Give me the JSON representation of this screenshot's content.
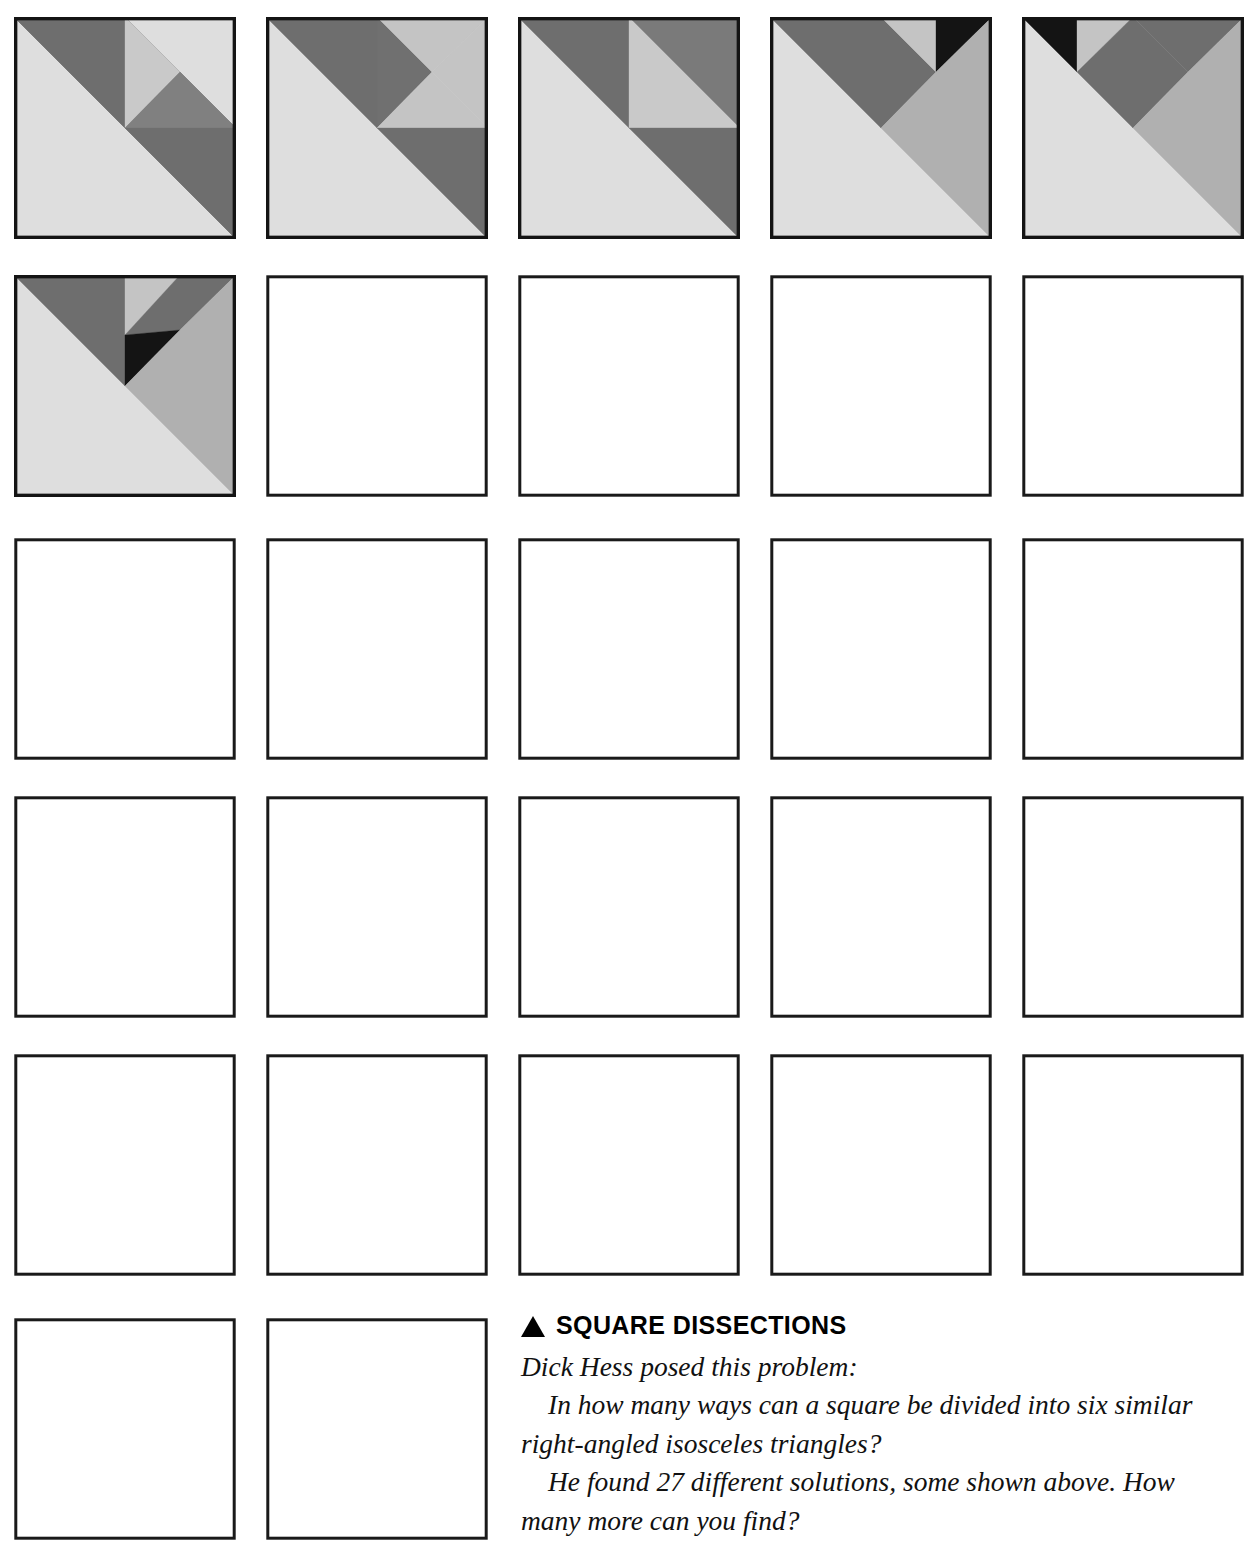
{
  "page": {
    "width": 1251,
    "height": 1553,
    "background": "#ffffff"
  },
  "palette": {
    "dark_gray": "#6e6e6e",
    "mid_gray": "#a8a8a8",
    "light_gray": "#bfbfbf",
    "pale_gray": "#dedede",
    "black": "#141414",
    "outline": "#141414",
    "white": "#ffffff"
  },
  "caption": {
    "bullet": "triangle-up-icon",
    "heading": "SQUARE DISSECTIONS",
    "attribution": "Dick Hess posed this problem:",
    "question": "In how many ways can a square be divided into six similar right-angled isosceles triangles?",
    "answer": "He found 27 different solutions, some shown above. How many more can you find?"
  },
  "grid": {
    "columns": 5,
    "rows": 6,
    "filled_count": 6,
    "empty_count": 21,
    "total_cells": 27,
    "cell_size": 222,
    "col_x": [
      14,
      266,
      518,
      770,
      1022
    ],
    "row_y": [
      17,
      275,
      538,
      796,
      1054,
      1318
    ],
    "row_counts": [
      5,
      5,
      5,
      5,
      5,
      2
    ]
  },
  "solutions": [
    {
      "index": 1,
      "label": "square-dissection-1",
      "filled": true,
      "pieces": [
        {
          "name": "large-lower-left-triangle",
          "color": "#dedede",
          "points": "0,0 0,222 222,222"
        },
        {
          "name": "upper-right-dark-band",
          "color": "#6e6e6e",
          "points": "0,0 222,222 222,111 111,0"
        },
        {
          "name": "upper-dark-left-wedge",
          "color": "#6e6e6e",
          "points": "0,0 111,0 111,111"
        },
        {
          "name": "small-pale-triangle",
          "color": "#c9c9c9",
          "points": "111,0 111,111 166,55"
        },
        {
          "name": "center-gray-triangle",
          "color": "#808080",
          "points": "111,111 166,55 222,111"
        },
        {
          "name": "mid-dark-triangle",
          "color": "#6e6e6e",
          "points": "111,111 222,111 222,222"
        }
      ]
    },
    {
      "index": 2,
      "label": "square-dissection-2",
      "filled": true,
      "pieces": [
        {
          "name": "large-lower-left-triangle",
          "color": "#dedede",
          "points": "0,0 0,222 222,222"
        },
        {
          "name": "upper-dark-band",
          "color": "#6e6e6e",
          "points": "0,0 111,111 111,0"
        },
        {
          "name": "quadrant-dark-corner",
          "color": "#707070",
          "points": "111,0 166,55 111,111"
        },
        {
          "name": "pale-upper-wedge",
          "color": "#c4c4c4",
          "points": "111,0 222,0 166,55"
        },
        {
          "name": "pale-right-wedge",
          "color": "#c4c4c4",
          "points": "222,0 222,111 166,55"
        },
        {
          "name": "pale-lower-quadrant",
          "color": "#c4c4c4",
          "points": "111,111 166,55 222,111"
        },
        {
          "name": "lower-right-dark",
          "color": "#6e6e6e",
          "points": "111,111 222,111 222,222"
        }
      ]
    },
    {
      "index": 3,
      "label": "square-dissection-3",
      "filled": true,
      "pieces": [
        {
          "name": "large-lower-left-triangle",
          "color": "#dedede",
          "points": "0,0 0,222 222,222"
        },
        {
          "name": "upper-dark-band",
          "color": "#6e6e6e",
          "points": "0,0 111,111 111,0"
        },
        {
          "name": "pale-quadrant-upper",
          "color": "#c9c9c9",
          "points": "111,0 222,111 111,111"
        },
        {
          "name": "dark-corner-right",
          "color": "#7a7a7a",
          "points": "111,0 222,0 222,111"
        },
        {
          "name": "lower-right-dark",
          "color": "#6e6e6e",
          "points": "111,111 222,111 222,222"
        }
      ]
    },
    {
      "index": 4,
      "label": "square-dissection-4",
      "filled": true,
      "pieces": [
        {
          "name": "large-lower-left-triangle",
          "color": "#dedede",
          "points": "0,0 0,222 222,222"
        },
        {
          "name": "upper-dark-band",
          "color": "#6e6e6e",
          "points": "0,0 111,111 111,0"
        },
        {
          "name": "mid-dark-wedge",
          "color": "#6e6e6e",
          "points": "111,0 166,55 111,111"
        },
        {
          "name": "pale-upper-wedge",
          "color": "#c4c4c4",
          "points": "111,0 166,0 166,55"
        },
        {
          "name": "black-corner-triangle",
          "color": "#141414",
          "points": "166,0 222,0 166,55"
        },
        {
          "name": "light-right-region",
          "color": "#b0b0b0",
          "points": "166,55 222,0 222,222 111,111"
        }
      ]
    },
    {
      "index": 5,
      "label": "square-dissection-5",
      "filled": true,
      "pieces": [
        {
          "name": "large-lower-left-triangle",
          "color": "#dedede",
          "points": "0,0 0,222 222,222"
        },
        {
          "name": "black-corner-triangle",
          "color": "#141414",
          "points": "0,0 55,0 55,55"
        },
        {
          "name": "pale-upper-wedge",
          "color": "#c4c4c4",
          "points": "55,0 111,0 55,55"
        },
        {
          "name": "dark-left-wedge",
          "color": "#6e6e6e",
          "points": "55,55 111,0 111,111"
        },
        {
          "name": "dark-right-wedge",
          "color": "#6e6e6e",
          "points": "111,0 166,55 111,111"
        },
        {
          "name": "dark-upper-right",
          "color": "#6e6e6e",
          "points": "111,0 222,0 166,55"
        },
        {
          "name": "light-right-region",
          "color": "#b0b0b0",
          "points": "166,55 222,0 222,222 111,111"
        }
      ]
    },
    {
      "index": 6,
      "label": "square-dissection-6",
      "filled": true,
      "pieces": [
        {
          "name": "large-lower-left-triangle",
          "color": "#dedede",
          "points": "0,0 0,222 222,222"
        },
        {
          "name": "upper-dark-band",
          "color": "#6e6e6e",
          "points": "0,0 111,111 111,0"
        },
        {
          "name": "pale-upper-wedge",
          "color": "#c4c4c4",
          "points": "111,0 111,60 166,0"
        },
        {
          "name": "dark-upper-right",
          "color": "#6e6e6e",
          "points": "166,0 222,0 166,55"
        },
        {
          "name": "dark-mid-wedge",
          "color": "#6e6e6e",
          "points": "111,60 166,0 166,55"
        },
        {
          "name": "black-center-triangle",
          "color": "#141414",
          "points": "111,60 166,55 111,111"
        },
        {
          "name": "light-right-region",
          "color": "#b0b0b0",
          "points": "166,55 222,0 222,222 111,111"
        }
      ]
    }
  ]
}
